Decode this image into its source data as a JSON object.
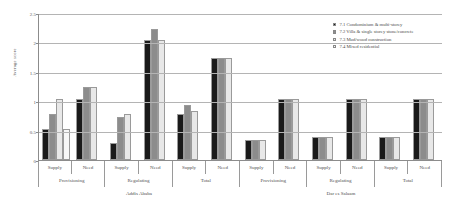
{
  "chart_data": {
    "type": "bar",
    "title": "",
    "xlabel": "",
    "ylabel": "Average score",
    "ylim": [
      0,
      2.5
    ],
    "yticks": [
      "0",
      "0.5",
      "1",
      "1.5",
      "2",
      "2.5"
    ],
    "grid": true,
    "legend_position": "top-right",
    "legend": [
      "7.1 Condominium & multi-storey",
      "7.2 Villa & single storey stone/concrete",
      "7.3 Mud/wood construction",
      "7.4 Mixed residential"
    ],
    "series": [
      {
        "name": "7.1 Condominium & multi-storey",
        "color": "#1a1a1a",
        "values": [
          0.5,
          1.0,
          0.25,
          2.0,
          0.75,
          1.7,
          0.3,
          1.0,
          0.35,
          1.0,
          0.35,
          1.0
        ]
      },
      {
        "name": "7.2 Villa & single storey stone/concrete",
        "color": "#8c8c8c",
        "values": [
          0.75,
          1.2,
          0.7,
          2.2,
          0.9,
          1.7,
          0.3,
          1.0,
          0.35,
          1.0,
          0.35,
          1.0
        ]
      },
      {
        "name": "7.3 Mud/wood construction",
        "color": "#e8e8e8",
        "values": [
          1.0,
          1.2,
          0.75,
          2.0,
          0.8,
          1.7,
          0.3,
          1.0,
          0.35,
          1.0,
          0.35,
          1.0
        ]
      },
      {
        "name": "7.4 Mixed residential",
        "color": "#f7f7f7",
        "values": [
          0.5,
          0,
          0,
          0,
          0,
          0,
          0,
          0,
          0,
          0,
          0,
          0
        ]
      }
    ],
    "categories": [
      "Supply",
      "Need",
      "Supply",
      "Need",
      "Supply",
      "Need",
      "Supply",
      "Need",
      "Supply",
      "Need",
      "Supply",
      "Need"
    ],
    "category_groups": [
      "Provisioning",
      "Regulating",
      "Total",
      "Provisioning",
      "Regulating",
      "Total"
    ],
    "city_groups": [
      "Addis Ababa",
      "Dar es Salaam"
    ]
  }
}
